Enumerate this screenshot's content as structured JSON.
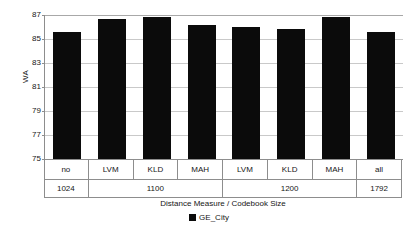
{
  "chart_data": {
    "type": "bar",
    "title": "",
    "xlabel": "Distance Measure / Codebook Size",
    "ylabel": "WA",
    "ylim": [
      75,
      87
    ],
    "yticks": [
      75,
      77,
      79,
      81,
      83,
      85,
      87
    ],
    "grid": true,
    "legend_position": "bottom",
    "categories": [
      "no",
      "LVM",
      "KLD",
      "MAH",
      "LVM",
      "KLD",
      "MAH",
      "all"
    ],
    "group_labels": [
      "1024",
      "1100",
      "1200",
      "1792"
    ],
    "group_spans": [
      1,
      3,
      3,
      1
    ],
    "series": [
      {
        "name": "GE_City",
        "color": "#0b0b0b",
        "values": [
          85.6,
          86.7,
          86.8,
          86.2,
          86.0,
          85.8,
          86.8,
          85.6
        ]
      }
    ]
  },
  "axes": {
    "y_title": "WA",
    "x_title": "Distance Measure / Codebook Size",
    "y_tick_labels": [
      "87",
      "85",
      "83",
      "81",
      "79",
      "77",
      "75"
    ]
  },
  "legend": {
    "entries": [
      {
        "label": "GE_City",
        "swatch_color": "#0b0b0b"
      }
    ]
  }
}
